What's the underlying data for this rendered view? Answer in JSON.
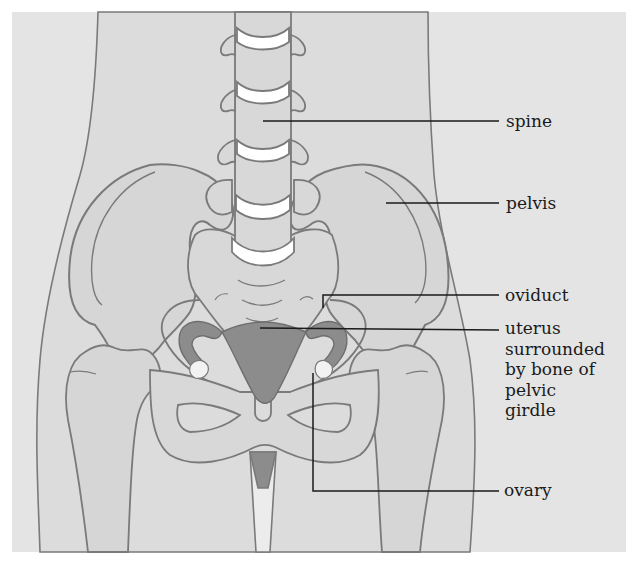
{
  "figure": {
    "type": "anatomical-diagram"
  },
  "labels": {
    "spine": "spine",
    "pelvis": "pelvis",
    "oviduct": "oviduct",
    "uterus_line1": "uterus",
    "uterus_line2": "surrounded",
    "uterus_line3": "by bone of",
    "uterus_line4": "pelvic",
    "uterus_line5": "girdle",
    "ovary": "ovary"
  },
  "colors": {
    "background": "#e4e4e4",
    "body_fill": "#dcdcdc",
    "bone_fill": "#d4d4d4",
    "outline": "#7a7a7a",
    "leader_line": "#1a1a1a",
    "organ_fill": "#8c8c8c",
    "disc_fill": "#ffffff"
  }
}
